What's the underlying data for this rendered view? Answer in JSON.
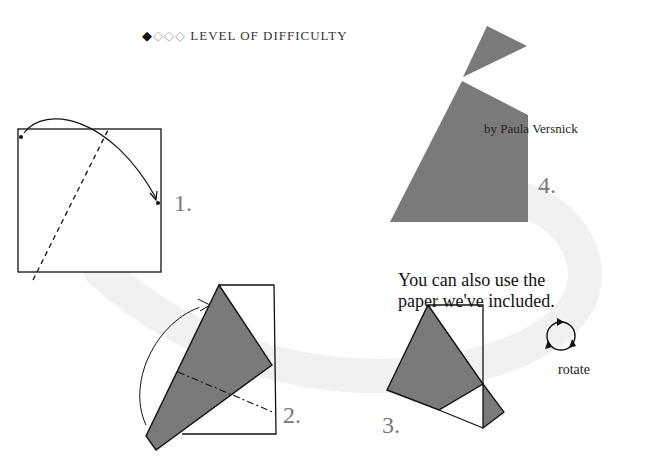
{
  "header": {
    "difficulty_filled": "◆",
    "difficulty_empty": "◇◇◇",
    "difficulty_label": "LEVEL OF DIFFICULTY",
    "difficulty_level": 1,
    "difficulty_max": 4
  },
  "author": "by Paula Versnick",
  "note": {
    "line1": "You can also use the",
    "line2": "paper we've included."
  },
  "steps": [
    {
      "number": "1.",
      "description": "square with dashed valley fold line; bring corner over"
    },
    {
      "number": "2.",
      "description": "folded shape with dash-dot fold line; fold flap up"
    },
    {
      "number": "3.",
      "description": "folded shape with small flap"
    },
    {
      "number": "4.",
      "description": "finished model"
    }
  ],
  "rotate": {
    "label": "rotate",
    "icon": "rotate-icon"
  },
  "colors": {
    "paper_fill": "#7a7a7a",
    "line": "#111111",
    "path_band": "#f2f2f2",
    "step_number": "#777777"
  }
}
